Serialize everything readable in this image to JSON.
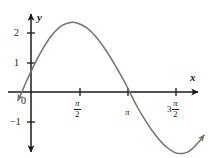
{
  "figure": {
    "background_color": "#ffffff",
    "axis_color": "#1a1a1a",
    "curve_color": "#7a6f6a",
    "label_color": "#1a1a1a"
  },
  "axes": {
    "x_label": "x",
    "y_label": "y",
    "origin_label": "0"
  },
  "x_ticks": [
    {
      "name": "pi-over-2",
      "lead": "",
      "numerator": "π",
      "denominator": "2",
      "value": 1.5708,
      "px": 80
    },
    {
      "name": "pi",
      "lead": "",
      "numerator": "π",
      "denominator": "",
      "value": 3.1416,
      "px": 128
    },
    {
      "name": "three-pi-over-2",
      "lead": "3",
      "numerator": "π",
      "denominator": "2",
      "value": 4.7124,
      "px": 176
    }
  ],
  "y_ticks": [
    {
      "name": "y-tick-2",
      "label": "2",
      "value": 2,
      "px": 33
    },
    {
      "name": "y-tick-1",
      "label": "1",
      "value": 1,
      "px": 63
    },
    {
      "name": "y-tick-neg1",
      "label": "−1",
      "value": -1,
      "px": 122
    }
  ],
  "chart_data": {
    "type": "line",
    "title": "",
    "xlabel": "x",
    "ylabel": "y",
    "grid": false,
    "legend": null,
    "xlim": [
      -0.45,
      5.6
    ],
    "ylim": [
      -2.0,
      2.85
    ],
    "x_tick_labels": [
      "π/2",
      "π",
      "3π/2"
    ],
    "x_tick_values": [
      1.5708,
      3.1416,
      4.7124
    ],
    "y_tick_labels": [
      "2",
      "1",
      "-1"
    ],
    "y_tick_values": [
      2,
      1,
      -1
    ],
    "series": [
      {
        "name": "curve",
        "amplitude": 2.4,
        "phase_shift": 0.3,
        "equation_approx": "y = 2.4 sin(x + 0.3)",
        "x": [
          -0.42,
          -0.3,
          -0.15,
          0.0,
          0.2,
          0.4,
          0.6,
          0.8,
          1.0,
          1.27,
          1.5,
          1.8,
          2.1,
          2.4,
          2.7,
          3.0,
          3.14,
          3.4,
          3.7,
          4.0,
          4.3,
          4.6,
          4.87,
          5.1,
          5.35,
          5.55
        ],
        "y": [
          -0.29,
          -0.02,
          0.36,
          0.71,
          1.14,
          1.53,
          1.86,
          2.12,
          2.3,
          2.4,
          2.37,
          2.2,
          1.88,
          1.44,
          0.92,
          0.35,
          0.05,
          -0.5,
          -1.04,
          -1.5,
          -1.86,
          -2.08,
          -2.12,
          -2.02,
          -1.76,
          -1.49
        ]
      }
    ]
  }
}
